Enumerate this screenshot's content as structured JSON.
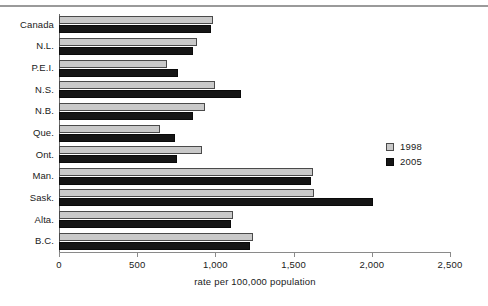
{
  "chart_data": {
    "type": "bar",
    "orientation": "horizontal",
    "title": "",
    "xlabel": "rate per 100,000 population",
    "ylabel": "",
    "xlim": [
      0,
      2500
    ],
    "xticks": [
      0,
      500,
      1000,
      1500,
      2000,
      2500
    ],
    "xtick_labels": [
      "0",
      "500",
      "1,000",
      "1,500",
      "2,000",
      "2,500"
    ],
    "grid": false,
    "legend_position": "right",
    "categories": [
      "Canada",
      "N.L.",
      "P.E.I.",
      "N.S.",
      "N.B.",
      "Que.",
      "Ont.",
      "Man.",
      "Sask.",
      "Alta.",
      "B.C."
    ],
    "series": [
      {
        "name": "1998",
        "color": "#c9c9c9",
        "values": [
          985,
          882,
          690,
          998,
          933,
          646,
          914,
          1624,
          1630,
          1112,
          1240
        ]
      },
      {
        "name": "2005",
        "color": "#151515",
        "values": [
          972,
          857,
          761,
          1164,
          857,
          742,
          755,
          1611,
          2008,
          1100,
          1221
        ]
      }
    ]
  },
  "legend": {
    "items": [
      {
        "label": "1998",
        "color": "#c9c9c9"
      },
      {
        "label": "2005",
        "color": "#151515"
      }
    ]
  },
  "axis": {
    "x_title": "rate per 100,000 population"
  }
}
